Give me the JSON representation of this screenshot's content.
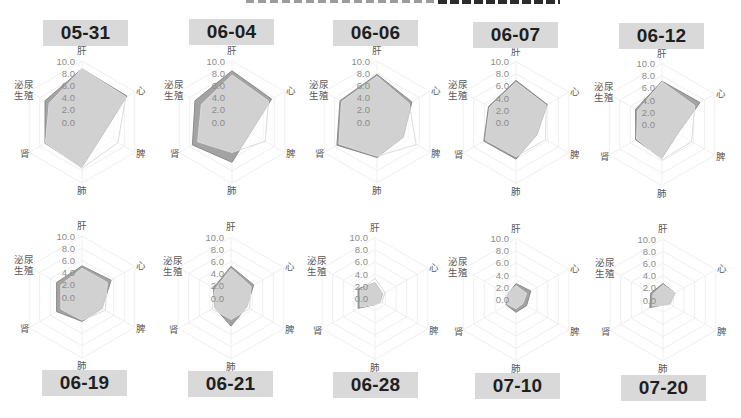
{
  "axes": {
    "labels": [
      "肝",
      "心",
      "脾",
      "肺",
      "肾",
      "泌尿生殖"
    ],
    "tick_labels": [
      "0.0",
      "2.0",
      "4.0",
      "6.0",
      "8.0",
      "10.0"
    ]
  },
  "colors": {
    "date_box_bg": "#d9d9d9",
    "date_text": "#1f1f1f",
    "series_dark_fill": "#a3a3a3",
    "series_dark_stroke": "#8a8a8a",
    "series_light_fill": "#ffffff",
    "series_light_fill_opacity": "0.5",
    "series_light_stroke": "#dcdcdc",
    "grid": "#efefef"
  },
  "charts": [
    {
      "date": "05-31"
    },
    {
      "date": "06-04"
    },
    {
      "date": "06-06"
    },
    {
      "date": "06-07"
    },
    {
      "date": "06-12"
    },
    {
      "date": "06-19"
    },
    {
      "date": "06-21"
    },
    {
      "date": "06-28"
    },
    {
      "date": "07-10"
    },
    {
      "date": "07-20"
    }
  ],
  "chart_data": [
    {
      "type": "radar",
      "title": "05-31",
      "categories": [
        "肝",
        "心",
        "脾",
        "肺",
        "肾",
        "泌尿生殖"
      ],
      "rlim": [
        0,
        10
      ],
      "ticks": [
        0,
        2,
        4,
        6,
        8,
        10
      ],
      "grid": true,
      "legend": "none",
      "series": [
        {
          "name": "dark",
          "values": [
            8.7,
            8.5,
            4.0,
            7.4,
            7.0,
            7.0
          ]
        },
        {
          "name": "light",
          "values": [
            8.7,
            8.3,
            6.8,
            7.6,
            6.9,
            6.2
          ]
        }
      ]
    },
    {
      "type": "radar",
      "title": "06-04",
      "categories": [
        "肝",
        "心",
        "脾",
        "肺",
        "肾",
        "泌尿生殖"
      ],
      "rlim": [
        0,
        10
      ],
      "ticks": [
        0,
        2,
        4,
        6,
        8,
        10
      ],
      "grid": true,
      "legend": "none",
      "series": [
        {
          "name": "dark",
          "values": [
            8.4,
            7.5,
            3.5,
            6.6,
            7.5,
            7.0
          ]
        },
        {
          "name": "light",
          "values": [
            7.7,
            6.9,
            6.3,
            5.0,
            6.5,
            5.8
          ]
        }
      ]
    },
    {
      "type": "radar",
      "title": "06-06",
      "categories": [
        "肝",
        "心",
        "脾",
        "肺",
        "肾",
        "泌尿生殖"
      ],
      "rlim": [
        0,
        10
      ],
      "ticks": [
        0,
        2,
        4,
        6,
        8,
        10
      ],
      "grid": true,
      "legend": "none",
      "series": [
        {
          "name": "dark",
          "values": [
            7.8,
            6.6,
            5.0,
            5.8,
            7.6,
            7.0
          ]
        },
        {
          "name": "light",
          "values": [
            7.5,
            6.1,
            7.4,
            5.6,
            7.2,
            6.7
          ]
        }
      ]
    },
    {
      "type": "radar",
      "title": "06-07",
      "categories": [
        "肝",
        "心",
        "脾",
        "肺",
        "肾",
        "泌尿生殖"
      ],
      "rlim": [
        0,
        10
      ],
      "ticks": [
        0,
        2,
        4,
        6,
        8,
        10
      ],
      "grid": true,
      "legend": "none",
      "series": [
        {
          "name": "dark",
          "values": [
            6.9,
            5.9,
            4.0,
            6.0,
            6.1,
            5.2
          ]
        },
        {
          "name": "light",
          "values": [
            6.6,
            5.7,
            5.6,
            5.6,
            5.8,
            5.0
          ]
        }
      ]
    },
    {
      "type": "radar",
      "title": "06-12",
      "categories": [
        "肝",
        "心",
        "脾",
        "肺",
        "肾",
        "泌尿生殖"
      ],
      "rlim": [
        0,
        10
      ],
      "ticks": [
        0,
        2,
        4,
        6,
        8,
        10
      ],
      "grid": true,
      "legend": "none",
      "series": [
        {
          "name": "dark",
          "values": [
            7.1,
            7.2,
            3.0,
            5.5,
            5.0,
            5.0
          ]
        },
        {
          "name": "light",
          "values": [
            7.0,
            6.2,
            5.6,
            5.8,
            4.8,
            4.6
          ]
        }
      ]
    },
    {
      "type": "radar",
      "title": "06-19",
      "categories": [
        "肝",
        "心",
        "脾",
        "肺",
        "肾",
        "泌尿生殖"
      ],
      "rlim": [
        0,
        10
      ],
      "ticks": [
        0,
        2,
        4,
        6,
        8,
        10
      ],
      "grid": true,
      "legend": "none",
      "series": [
        {
          "name": "dark",
          "values": [
            5.1,
            5.5,
            3.8,
            4.0,
            4.8,
            4.8
          ]
        },
        {
          "name": "light",
          "values": [
            4.7,
            4.8,
            4.4,
            3.8,
            4.0,
            4.0
          ]
        }
      ]
    },
    {
      "type": "radar",
      "title": "06-21",
      "categories": [
        "肝",
        "心",
        "脾",
        "肺",
        "肾",
        "泌尿生殖"
      ],
      "rlim": [
        0,
        10
      ],
      "ticks": [
        0,
        2,
        4,
        6,
        8,
        10
      ],
      "grid": true,
      "legend": "none",
      "series": [
        {
          "name": "dark",
          "values": [
            5.2,
            4.3,
            3.0,
            4.6,
            3.1,
            3.3
          ]
        },
        {
          "name": "light",
          "values": [
            4.8,
            3.8,
            3.5,
            3.5,
            3.6,
            3.0
          ]
        }
      ]
    },
    {
      "type": "radar",
      "title": "06-28",
      "categories": [
        "肝",
        "心",
        "脾",
        "肺",
        "肾",
        "泌尿生殖"
      ],
      "rlim": [
        0,
        10
      ],
      "ticks": [
        0,
        2,
        4,
        6,
        8,
        10
      ],
      "grid": true,
      "legend": "none",
      "series": [
        {
          "name": "dark",
          "values": [
            2.6,
            1.5,
            1.0,
            1.0,
            3.2,
            3.2
          ]
        },
        {
          "name": "light",
          "values": [
            3.3,
            1.9,
            1.3,
            1.0,
            2.8,
            2.8
          ]
        }
      ]
    },
    {
      "type": "radar",
      "title": "07-10",
      "categories": [
        "肝",
        "心",
        "脾",
        "肺",
        "肾",
        "泌尿生殖"
      ],
      "rlim": [
        0,
        10
      ],
      "ticks": [
        0,
        2,
        4,
        6,
        8,
        10
      ],
      "grid": true,
      "legend": "none",
      "series": [
        {
          "name": "dark",
          "values": [
            2.6,
            2.8,
            2.0,
            2.1,
            1.8,
            1.6
          ]
        },
        {
          "name": "light",
          "values": [
            2.3,
            2.0,
            1.3,
            1.5,
            1.6,
            1.7
          ]
        }
      ]
    },
    {
      "type": "radar",
      "title": "07-20",
      "categories": [
        "肝",
        "心",
        "脾",
        "肺",
        "肾",
        "泌尿生殖"
      ],
      "rlim": [
        0,
        10
      ],
      "ticks": [
        0,
        2,
        4,
        6,
        8,
        10
      ],
      "grid": true,
      "legend": "none",
      "series": [
        {
          "name": "dark",
          "values": [
            2.7,
            2.3,
            1.3,
            0.8,
            2.5,
            2.3
          ]
        },
        {
          "name": "light",
          "values": [
            2.5,
            2.3,
            1.4,
            0.9,
            2.0,
            1.9
          ]
        }
      ]
    }
  ]
}
